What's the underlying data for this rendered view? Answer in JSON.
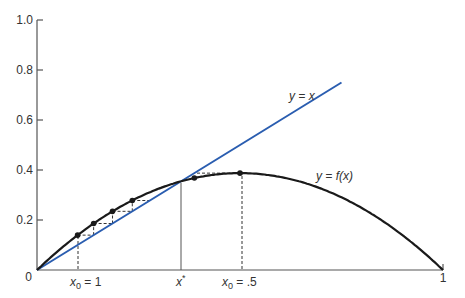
{
  "chart_data": {
    "type": "line",
    "title": "",
    "xlabel": "",
    "ylabel": "",
    "xlim": [
      0,
      1
    ],
    "ylim": [
      0,
      1.0
    ],
    "grid": false,
    "y_ticks": [
      {
        "value": 0,
        "label": "0"
      },
      {
        "value": 0.2,
        "label": "0.2"
      },
      {
        "value": 0.4,
        "label": "0.4"
      },
      {
        "value": 0.6,
        "label": "0.6"
      },
      {
        "value": 0.8,
        "label": "0.8"
      },
      {
        "value": 1.0,
        "label": "1.0"
      }
    ],
    "x_ticks": [
      {
        "value": 1,
        "label": "1"
      }
    ],
    "series": [
      {
        "name": "y = x",
        "color": "#2a5db0",
        "x": [
          0,
          0.75
        ],
        "values": [
          0,
          0.75
        ]
      },
      {
        "name": "y = f(x)",
        "color": "#1a1a1a",
        "function": "r*x*(1-x)",
        "r": 1.55
      }
    ],
    "annotations": [
      {
        "type": "x-marker",
        "x": 0.1,
        "label_main": "x",
        "label_sub": "0",
        "label_rest": " = 1",
        "style": "dashed"
      },
      {
        "type": "x-marker",
        "x": 0.355,
        "label_main": "x",
        "label_sup": "*",
        "style": "solid"
      },
      {
        "type": "x-marker",
        "x": 0.5,
        "label_main": "x",
        "label_sub": "0",
        "label_rest": " = .5",
        "style": "dashed"
      }
    ],
    "cobweb_points_left": [
      [
        0.1,
        0.1395
      ],
      [
        0.1395,
        0.186
      ],
      [
        0.186,
        0.2347
      ],
      [
        0.2347,
        0.278
      ]
    ],
    "cobweb_points_right": [
      [
        0.5,
        0.3875
      ],
      [
        0.3875,
        0.368
      ]
    ],
    "series_labels": {
      "identity": "y = x",
      "curve": "y = f(x)"
    }
  },
  "labels": {
    "y0": "0",
    "y02": "0.2",
    "y04": "0.4",
    "y06": "0.6",
    "y08": "0.8",
    "y10": "1.0",
    "x1": "1",
    "identity": "y = x",
    "curve_y": "y = ",
    "curve_f": "f(x)",
    "x0a_main": "x",
    "x0a_sub": "0",
    "x0a_rest": " = 1",
    "xstar_main": "x",
    "xstar_sup": "*",
    "x0b_main": "x",
    "x0b_sub": "0",
    "x0b_rest": " = .5"
  },
  "colors": {
    "identity_line": "#2a5db0",
    "curve": "#1a1a1a",
    "axis": "#555555"
  }
}
